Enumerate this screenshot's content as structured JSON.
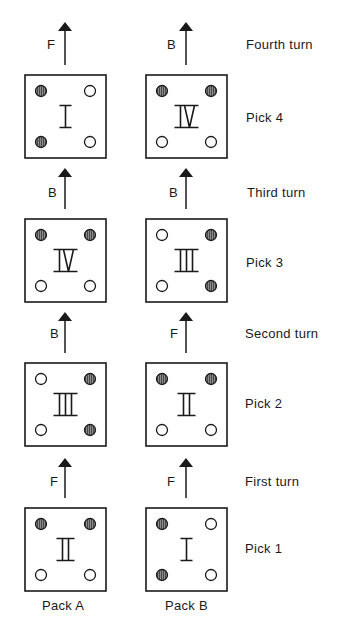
{
  "colors": {
    "ink": "#1a1a1a",
    "hole_filled": "#555555",
    "hole_empty": "#ffffff",
    "background": "#ffffff"
  },
  "columns": [
    {
      "id": "A",
      "label": "Pack A"
    },
    {
      "id": "B",
      "label": "Pack B"
    }
  ],
  "rows": [
    {
      "pick_label": "Pick 4",
      "turn_label": "Fourth turn",
      "cells": [
        {
          "numeral": "I",
          "holes": {
            "tl": "filled",
            "tr": "empty",
            "bl": "filled",
            "br": "empty"
          },
          "turn_direction": "F"
        },
        {
          "numeral": "IV",
          "holes": {
            "tl": "filled",
            "tr": "filled",
            "bl": "empty",
            "br": "empty"
          },
          "turn_direction": "B"
        }
      ]
    },
    {
      "pick_label": "Pick 3",
      "turn_label": "Third turn",
      "cells": [
        {
          "numeral": "IV",
          "holes": {
            "tl": "filled",
            "tr": "filled",
            "bl": "empty",
            "br": "empty"
          },
          "turn_direction": "B"
        },
        {
          "numeral": "III",
          "holes": {
            "tl": "empty",
            "tr": "filled",
            "bl": "empty",
            "br": "filled"
          },
          "turn_direction": "B"
        }
      ]
    },
    {
      "pick_label": "Pick 2",
      "turn_label": "Second turn",
      "cells": [
        {
          "numeral": "III",
          "holes": {
            "tl": "empty",
            "tr": "filled",
            "bl": "empty",
            "br": "filled"
          },
          "turn_direction": "B"
        },
        {
          "numeral": "II",
          "holes": {
            "tl": "filled",
            "tr": "filled",
            "bl": "empty",
            "br": "empty"
          },
          "turn_direction": "F"
        }
      ]
    },
    {
      "pick_label": "Pick 1",
      "turn_label": "First turn",
      "cells": [
        {
          "numeral": "II",
          "holes": {
            "tl": "filled",
            "tr": "filled",
            "bl": "empty",
            "br": "empty"
          },
          "turn_direction": "F"
        },
        {
          "numeral": "I",
          "holes": {
            "tl": "filled",
            "tr": "empty",
            "bl": "filled",
            "br": "empty"
          },
          "turn_direction": "F"
        }
      ]
    }
  ],
  "icons": {
    "arrow": "up-arrow-icon",
    "hole_filled": "filled-hole-icon",
    "hole_empty": "empty-hole-icon"
  }
}
